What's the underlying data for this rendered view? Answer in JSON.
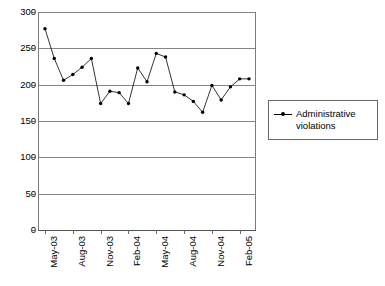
{
  "chart_data": {
    "type": "line",
    "title": "",
    "xlabel": "",
    "ylabel": "",
    "ylim": [
      0,
      300
    ],
    "ytick_values": [
      0,
      50,
      100,
      150,
      200,
      250,
      300
    ],
    "ytick_labels": [
      "0",
      "50",
      "100",
      "150",
      "200",
      "250",
      "300"
    ],
    "grid": true,
    "legend_position": "right",
    "x": [
      "May-03",
      "Jun-03",
      "Jul-03",
      "Aug-03",
      "Sep-03",
      "Oct-03",
      "Nov-03",
      "Dec-03",
      "Jan-04",
      "Feb-04",
      "Mar-04",
      "Apr-04",
      "May-04",
      "Jun-04",
      "Jul-04",
      "Aug-04",
      "Sep-04",
      "Oct-04",
      "Nov-04",
      "Dec-04",
      "Jan-05",
      "Feb-05",
      "Mar-05"
    ],
    "xtick_labels": [
      "May-03",
      "Aug-03",
      "Nov-03",
      "Feb-04",
      "May-04",
      "Aug-04",
      "Nov-04",
      "Feb-05"
    ],
    "xtick_indices": [
      0,
      3,
      6,
      9,
      12,
      15,
      18,
      21
    ],
    "series": [
      {
        "name": "Administrative violations",
        "marker": "filled-circle",
        "color": "#000000",
        "values": [
          277,
          236,
          206,
          214,
          224,
          236,
          174,
          191,
          189,
          174,
          223,
          204,
          243,
          238,
          190,
          186,
          177,
          162,
          199,
          179,
          197,
          208,
          208
        ]
      }
    ]
  },
  "legend": {
    "entries": [
      {
        "label": "Administrative violations"
      }
    ]
  },
  "colors": {
    "series": "#000000",
    "gridline": "#858585",
    "axis": "#555555",
    "legend_border": "#666666"
  }
}
